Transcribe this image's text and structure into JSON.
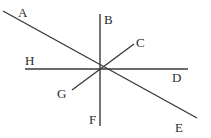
{
  "figure": {
    "width": 211,
    "height": 138,
    "background_color": "#ffffff",
    "stroke_color": "#3a3a3a",
    "stroke_width": 1.4,
    "label_color": "#2b2b2b",
    "intersection": {
      "x": 100,
      "y": 69
    },
    "lines": [
      {
        "name": "line-AE",
        "from_label": "A",
        "to_label": "E",
        "x1": 3,
        "y1": 11,
        "x2": 197,
        "y2": 118
      },
      {
        "name": "line-BF",
        "from_label": "B",
        "to_label": "F",
        "x1": 100,
        "y1": 14,
        "x2": 100,
        "y2": 126
      },
      {
        "name": "line-HD",
        "from_label": "H",
        "to_label": "D",
        "x1": 25,
        "y1": 69,
        "x2": 188,
        "y2": 69
      },
      {
        "name": "line-CG",
        "from_label": "C",
        "to_label": "G",
        "x1": 134,
        "y1": 44,
        "x2": 72,
        "y2": 90
      }
    ],
    "labels": [
      {
        "name": "label-A",
        "text": "A",
        "x": 18,
        "y": 6
      },
      {
        "name": "label-B",
        "text": "B",
        "x": 104,
        "y": 13
      },
      {
        "name": "label-C",
        "text": "C",
        "x": 136,
        "y": 36
      },
      {
        "name": "label-D",
        "text": "D",
        "x": 172,
        "y": 71
      },
      {
        "name": "label-E",
        "text": "E",
        "x": 175,
        "y": 121
      },
      {
        "name": "label-F",
        "text": "F",
        "x": 89,
        "y": 113
      },
      {
        "name": "label-G",
        "text": "G",
        "x": 57,
        "y": 87
      },
      {
        "name": "label-H",
        "text": "H",
        "x": 25,
        "y": 54
      }
    ]
  }
}
